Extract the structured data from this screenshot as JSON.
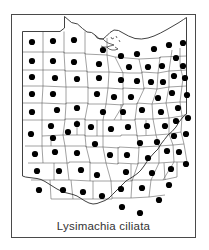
{
  "figure": {
    "caption": "Lysimachia ciliata",
    "frame_color": "#4a4a4a",
    "background_color": "#ffffff",
    "map_subject": "Ohio",
    "map_outline_color": "#2b2b2b",
    "county_line_color": "#555555",
    "dot_color": "#000000",
    "dot_radius": 3.1,
    "total_counties": 88,
    "counties_with_records": 87
  },
  "chart_data": {
    "type": "map",
    "title": "Lysimachia ciliata",
    "subtitle": "",
    "region": "Ohio",
    "unit": "county",
    "symbol": "filled-circle",
    "legend": [],
    "grid": false,
    "xlabel": "",
    "ylabel": "",
    "state_outline": "M 53.5,2.5 L 60.5,8.5 L 66.5,10.0 L 71.5,14.5 L 76.0,18.0 L 80.5,18.5 L 84.0,21.0 L 88.0,24.5 L 92.0,25.0 L 95.5,22.0 L 99.0,18.5 L 103.0,16.0 L 107.5,16.5 L 112.0,19.0 L 117.5,22.0 L 124.0,24.5 L 130.5,25.0 L 137.0,24.0 L 143.0,22.0 L 149.5,19.0 L 156.0,15.5 L 162.0,12.0 L 168.0,8.5 L 172.5,5.5 L 175.5,3.5 L 175.5,17.0 L 175.5,40.0 L 175.5,62.0 L 175.5,84.0 L 175.5,100.0 L 172.0,103.0 L 168.0,108.0 L 165.0,113.0 L 161.0,117.5 L 157.0,121.0 L 153.5,125.5 L 150.0,130.0 L 147.0,135.0 L 143.0,139.0 L 139.5,143.0 L 136.0,147.5 L 133.0,152.0 L 130.0,156.0 L 127.0,159.0 L 123.0,162.0 L 119.0,164.5 L 115.0,167.0 L 112.0,170.0 L 108.5,173.5 L 105.0,177.0 L 101.5,180.5 L 98.0,184.0 L 94.0,186.5 L 90.0,188.0 L 86.0,189.5 L 82.0,190.0 L 78.0,189.0 L 74.0,187.0 L 70.0,184.5 L 66.0,182.0 L 62.0,180.5 L 58.0,179.5 L 54.0,178.5 L 50.0,177.0 L 46.0,175.0 L 42.0,172.5 L 38.0,170.0 L 34.0,167.5 L 30.0,165.5 L 26.0,164.5 L 22.0,164.0 L 18.0,163.5 L 14.5,163.0 L 11.5,162.0 L 11.5,140.0 L 11.5,118.0 L 11.5,96.0 L 11.5,74.0 L 11.5,52.0 L 11.5,30.0 L 11.5,17.5 L 20.0,17.5 L 30.0,17.5 L 40.0,17.5 L 49.0,17.5 L 53.5,14.0 Z",
    "dots": [
      {
        "county": "Williams",
        "x": 21,
        "y": 28
      },
      {
        "county": "Fulton",
        "x": 42,
        "y": 27
      },
      {
        "county": "Lucas",
        "x": 63,
        "y": 26
      },
      {
        "county": "Ottawa",
        "x": 92,
        "y": 36
      },
      {
        "county": "Erie",
        "x": 110,
        "y": 42
      },
      {
        "county": "Lorain",
        "x": 126,
        "y": 40
      },
      {
        "county": "Cuyahoga",
        "x": 143,
        "y": 35
      },
      {
        "county": "Lake",
        "x": 158,
        "y": 31
      },
      {
        "county": "Ashtabula",
        "x": 172,
        "y": 29
      },
      {
        "county": "Defiance",
        "x": 21,
        "y": 47
      },
      {
        "county": "Henry",
        "x": 42,
        "y": 47
      },
      {
        "county": "Wood",
        "x": 63,
        "y": 48
      },
      {
        "county": "Sandusky",
        "x": 88,
        "y": 50
      },
      {
        "county": "Huron",
        "x": 118,
        "y": 53
      },
      {
        "county": "Medina",
        "x": 137,
        "y": 53
      },
      {
        "county": "Summit",
        "x": 151,
        "y": 52
      },
      {
        "county": "Geauga",
        "x": 165,
        "y": 44
      },
      {
        "county": "Trumbull",
        "x": 172,
        "y": 52
      },
      {
        "county": "Paulding",
        "x": 21,
        "y": 63
      },
      {
        "county": "Putnam",
        "x": 44,
        "y": 64
      },
      {
        "county": "Hancock",
        "x": 66,
        "y": 65
      },
      {
        "county": "Seneca",
        "x": 88,
        "y": 64
      },
      {
        "county": "Crawford",
        "x": 110,
        "y": 66
      },
      {
        "county": "Richland",
        "x": 126,
        "y": 67
      },
      {
        "county": "Ashland",
        "x": 140,
        "y": 68
      },
      {
        "county": "Wayne",
        "x": 152,
        "y": 68
      },
      {
        "county": "Portage",
        "x": 163,
        "y": 62
      },
      {
        "county": "Mahoning",
        "x": 174,
        "y": 64
      },
      {
        "county": "Van Wert",
        "x": 21,
        "y": 80
      },
      {
        "county": "Allen",
        "x": 42,
        "y": 80
      },
      {
        "county": "Wyandot",
        "x": 86,
        "y": 80
      },
      {
        "county": "Marion",
        "x": 103,
        "y": 83
      },
      {
        "county": "Morrow",
        "x": 120,
        "y": 83
      },
      {
        "county": "Holmes",
        "x": 147,
        "y": 84
      },
      {
        "county": "Stark",
        "x": 161,
        "y": 79
      },
      {
        "county": "Columbiana",
        "x": 176,
        "y": 81
      },
      {
        "county": "Mercer",
        "x": 21,
        "y": 98
      },
      {
        "county": "Auglaize",
        "x": 46,
        "y": 96
      },
      {
        "county": "Hardin",
        "x": 66,
        "y": 94
      },
      {
        "county": "Union",
        "x": 92,
        "y": 98
      },
      {
        "county": "Delaware",
        "x": 112,
        "y": 98
      },
      {
        "county": "Knox",
        "x": 131,
        "y": 96
      },
      {
        "county": "Coshocton",
        "x": 150,
        "y": 98
      },
      {
        "county": "Carroll",
        "x": 167,
        "y": 94
      },
      {
        "county": "Shelby",
        "x": 40,
        "y": 112
      },
      {
        "county": "Logan",
        "x": 66,
        "y": 110
      },
      {
        "county": "Champaign",
        "x": 80,
        "y": 113
      },
      {
        "county": "Madison",
        "x": 100,
        "y": 115
      },
      {
        "county": "Franklin",
        "x": 117,
        "y": 113
      },
      {
        "county": "Licking",
        "x": 136,
        "y": 112
      },
      {
        "county": "Muskingum",
        "x": 154,
        "y": 112
      },
      {
        "county": "Tuscarawas",
        "x": 165,
        "y": 107
      },
      {
        "county": "Jefferson",
        "x": 177,
        "y": 104
      },
      {
        "county": "Darke",
        "x": 20,
        "y": 120
      },
      {
        "county": "Miami",
        "x": 42,
        "y": 124
      },
      {
        "county": "Clark",
        "x": 84,
        "y": 130
      },
      {
        "county": "Fairfield",
        "x": 129,
        "y": 129
      },
      {
        "county": "Perry",
        "x": 146,
        "y": 128
      },
      {
        "county": "Guernsey",
        "x": 163,
        "y": 122
      },
      {
        "county": "Harrison",
        "x": 175,
        "y": 120
      },
      {
        "county": "Preble",
        "x": 24,
        "y": 140
      },
      {
        "county": "Montgomery",
        "x": 44,
        "y": 138
      },
      {
        "county": "Greene",
        "x": 66,
        "y": 139
      },
      {
        "county": "Fayette",
        "x": 99,
        "y": 141
      },
      {
        "county": "Pickaway",
        "x": 116,
        "y": 141
      },
      {
        "county": "Hocking",
        "x": 137,
        "y": 144
      },
      {
        "county": "Morgan",
        "x": 156,
        "y": 137
      },
      {
        "county": "Noble",
        "x": 168,
        "y": 138
      },
      {
        "county": "Washington",
        "x": 175,
        "y": 150
      },
      {
        "county": "Butler",
        "x": 26,
        "y": 157
      },
      {
        "county": "Warren",
        "x": 48,
        "y": 157
      },
      {
        "county": "Clinton",
        "x": 70,
        "y": 156
      },
      {
        "county": "Highland",
        "x": 86,
        "y": 161
      },
      {
        "county": "Ross",
        "x": 115,
        "y": 158
      },
      {
        "county": "Vinton",
        "x": 141,
        "y": 159
      },
      {
        "county": "Athens",
        "x": 160,
        "y": 155
      },
      {
        "county": "Hamilton",
        "x": 28,
        "y": 176
      },
      {
        "county": "Clermont",
        "x": 52,
        "y": 176
      },
      {
        "county": "Brown",
        "x": 72,
        "y": 178
      },
      {
        "county": "Adams",
        "x": 91,
        "y": 182
      },
      {
        "county": "Pike",
        "x": 110,
        "y": 175
      },
      {
        "county": "Jackson",
        "x": 131,
        "y": 174
      },
      {
        "county": "Meigs",
        "x": 158,
        "y": 171
      },
      {
        "county": "Gallia",
        "x": 148,
        "y": 186
      },
      {
        "county": "Scioto",
        "x": 111,
        "y": 193
      },
      {
        "county": "Lawrence",
        "x": 129,
        "y": 199
      },
      {
        "county": "Knox2",
        "x": 57,
        "y": 118
      }
    ]
  }
}
